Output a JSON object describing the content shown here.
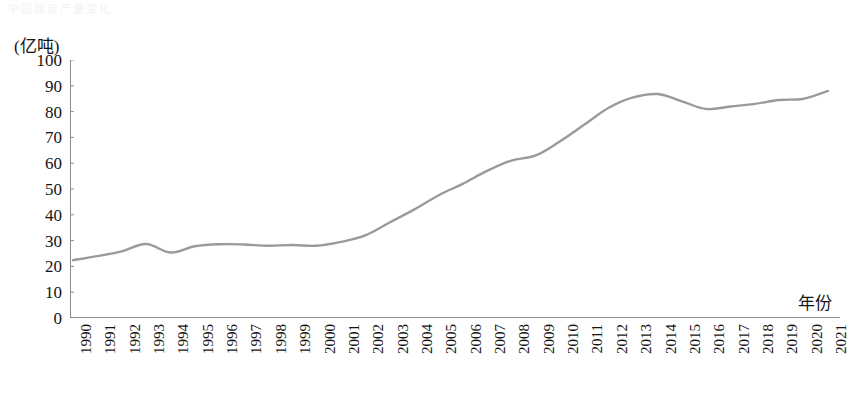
{
  "page": {
    "faint_header_text": "中国煤炭产量变化"
  },
  "axes": {
    "y_unit_label": "(亿吨)",
    "x_axis_title": "年份",
    "y_ticks": [
      100,
      90,
      80,
      70,
      60,
      50,
      40,
      30,
      20,
      10,
      0
    ],
    "line_color": "#9a9a9a",
    "axis_color": "#8c8c8c",
    "text_color": "#141414"
  },
  "chart_data": {
    "type": "line",
    "title": "",
    "subtitle": "",
    "xlabel": "年份",
    "ylabel": "(亿吨)",
    "ylim": [
      0,
      100
    ],
    "ytick_step": 10,
    "grid": false,
    "legend": "none",
    "x": [
      1990,
      1991,
      1992,
      1993,
      1994,
      1995,
      1996,
      1997,
      1998,
      1999,
      2000,
      2001,
      2002,
      2003,
      2004,
      2005,
      2006,
      2007,
      2008,
      2009,
      2010,
      2011,
      2012,
      2013,
      2014,
      2015,
      2016,
      2017,
      2018,
      2019,
      2020,
      2021
    ],
    "categories": [
      "1990",
      "1991",
      "1992",
      "1993",
      "1994",
      "1995",
      "1996",
      "1997",
      "1998",
      "1999",
      "2000",
      "2001",
      "2002",
      "2003",
      "2004",
      "2005",
      "2006",
      "2007",
      "2008",
      "2009",
      "2010",
      "2011",
      "2012",
      "2013",
      "2014",
      "2015",
      "2016",
      "2017",
      "2018",
      "2019",
      "2020",
      "2021"
    ],
    "series": [
      {
        "name": "产量",
        "values": [
          22.4,
          24.0,
          25.8,
          28.7,
          25.4,
          27.8,
          28.6,
          28.5,
          28.0,
          28.3,
          28.0,
          29.5,
          32.0,
          37.0,
          42.0,
          47.5,
          52.0,
          57.0,
          61.0,
          63.0,
          68.5,
          75.0,
          81.5,
          85.5,
          86.8,
          84.0,
          81.0,
          82.0,
          83.0,
          84.5,
          85.0,
          88.0
        ]
      }
    ]
  }
}
